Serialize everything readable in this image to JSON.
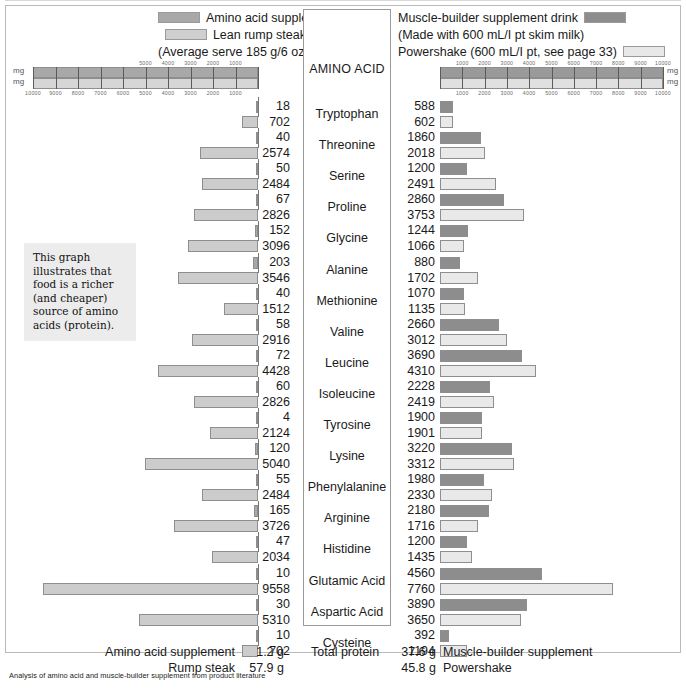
{
  "legend": {
    "left": [
      {
        "label": "Amino acid supplement",
        "swatch": "dark"
      },
      {
        "label": "Lean rump steak",
        "swatch": "light"
      },
      {
        "label": "(Average serve 185 g/6 oz)",
        "swatch": null
      }
    ],
    "right": [
      {
        "label": "Muscle-builder supplement drink",
        "swatch": "rdark"
      },
      {
        "label": "(Made with 600 mL/I pt skim milk)",
        "swatch": null
      },
      {
        "label": "Powershake (600 mL/I pt, see page 33)",
        "swatch": "rlight"
      }
    ]
  },
  "column_header": "AMINO ACID",
  "note": "This graph illustrates that food is a richer (and cheaper) source of amino acids (protein).",
  "units": {
    "mg_top": "mg",
    "mg_bottom": "mg"
  },
  "axes": {
    "left_top_ticks": [
      "5000",
      "4000",
      "3000",
      "2000",
      "1000"
    ],
    "left_bottom_ticks": [
      "10000",
      "9000",
      "8000",
      "7000",
      "6000",
      "5000",
      "4000",
      "3000",
      "2000",
      "1000"
    ],
    "right_top_ticks": [
      "1000",
      "2000",
      "3000",
      "4000",
      "5000",
      "6000",
      "7000",
      "8000",
      "9000",
      "10000"
    ],
    "right_bottom_ticks": [
      "1000",
      "2000",
      "3000",
      "4000",
      "5000",
      "6000",
      "7000",
      "8000",
      "9000",
      "10000"
    ],
    "max": 10000
  },
  "totals": {
    "left": [
      {
        "label": "Amino acid supplement",
        "value": "1.2 g"
      },
      {
        "label": "Rump steak",
        "value": "57.9 g"
      }
    ],
    "right_label": "Total protein",
    "right": [
      {
        "value": "37.6 g",
        "label": "Muscle-builder supplement"
      },
      {
        "value": "45.8 g",
        "label": "Powershake"
      }
    ]
  },
  "caption": "Analysis of amino acid and muscle-builder supplement from product literature",
  "chart_data": {
    "type": "bar",
    "xlabel": "mg",
    "ylabel": "Amino acid",
    "orientation": "horizontal-mirrored",
    "xlim": [
      0,
      10000
    ],
    "grid": true,
    "legend_position": "top",
    "categories": [
      "Tryptophan",
      "Threonine",
      "Serine",
      "Proline",
      "Glycine",
      "Alanine",
      "Methionine",
      "Valine",
      "Leucine",
      "Isoleucine",
      "Tyrosine",
      "Lysine",
      "Phenylalanine",
      "Arginine",
      "Histidine",
      "Glutamic Acid",
      "Aspartic Acid",
      "Cysteine"
    ],
    "series": [
      {
        "name": "Amino acid supplement",
        "side": "left",
        "color": "#a8a8a8",
        "values": [
          18,
          40,
          50,
          67,
          152,
          203,
          40,
          58,
          72,
          60,
          4,
          120,
          55,
          165,
          47,
          10,
          30,
          10
        ]
      },
      {
        "name": "Lean rump steak",
        "side": "left",
        "color": "#cccccc",
        "values": [
          702,
          2574,
          2484,
          2826,
          3096,
          3546,
          1512,
          2916,
          4428,
          2826,
          2124,
          5040,
          2484,
          3726,
          2034,
          9558,
          5310,
          702
        ]
      },
      {
        "name": "Muscle-builder supplement drink",
        "side": "right",
        "color": "#8d8d8d",
        "values": [
          588,
          1860,
          1200,
          2860,
          1244,
          880,
          1070,
          2660,
          3690,
          2228,
          1900,
          3220,
          1980,
          2180,
          1200,
          4560,
          3890,
          392
        ]
      },
      {
        "name": "Powershake",
        "side": "right",
        "color": "#e9e9e9",
        "values": [
          602,
          2018,
          2491,
          3753,
          1066,
          1702,
          1135,
          3012,
          4310,
          2419,
          1901,
          3312,
          2330,
          1716,
          1435,
          7760,
          3650,
          1194
        ]
      }
    ],
    "totals": {
      "Amino acid supplement": "1.2 g",
      "Rump steak": "57.9 g",
      "Muscle-builder supplement": "37.6 g",
      "Powershake": "45.8 g"
    }
  }
}
